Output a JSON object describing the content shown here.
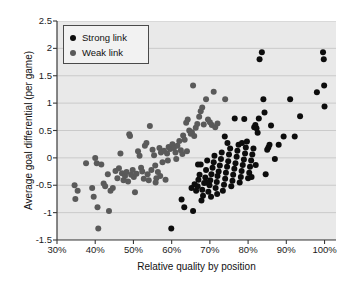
{
  "chart_data": {
    "type": "scatter",
    "title": "",
    "xlabel": "Relative quality by position",
    "ylabel": "Average goal differential (per game)",
    "xlim": [
      30,
      103
    ],
    "ylim": [
      -1.5,
      2.5
    ],
    "xticks": [
      "30%",
      "40%",
      "50%",
      "60%",
      "70%",
      "80%",
      "90%",
      "100%"
    ],
    "xtick_values": [
      30,
      40,
      50,
      60,
      70,
      80,
      90,
      100
    ],
    "yticks": [
      "2.5",
      "2",
      "1.5",
      "1",
      "0.5",
      "0",
      "-0.5",
      "-1",
      "-1.5"
    ],
    "ytick_values": [
      2.5,
      2,
      1.5,
      1,
      0.5,
      0,
      -0.5,
      -1,
      -1.5
    ],
    "grid": "horizontal",
    "legend_position": "top-left",
    "plot_background": "#e9e9e9",
    "series": [
      {
        "name": "Strong link",
        "color": "#0d0d0d",
        "marker": "circle",
        "points": [
          [
            59.9,
            -1.29
          ],
          [
            62.6,
            -0.76
          ],
          [
            65.6,
            -0.97
          ],
          [
            63.3,
            -0.9
          ],
          [
            65.2,
            -0.55
          ],
          [
            66.0,
            -0.48
          ],
          [
            66.4,
            -0.6
          ],
          [
            66.8,
            -0.52
          ],
          [
            67.0,
            -0.4
          ],
          [
            67.3,
            -0.31
          ],
          [
            67.6,
            -0.12
          ],
          [
            68.0,
            -0.58
          ],
          [
            68.2,
            -0.69
          ],
          [
            68.5,
            -0.46
          ],
          [
            68.8,
            -0.36
          ],
          [
            69.0,
            -0.22
          ],
          [
            69.3,
            -0.05
          ],
          [
            69.6,
            -0.62
          ],
          [
            69.9,
            -0.5
          ],
          [
            70.1,
            -0.41
          ],
          [
            70.4,
            -0.3
          ],
          [
            70.7,
            -0.18
          ],
          [
            71.0,
            -0.08
          ],
          [
            71.2,
            0.04
          ],
          [
            71.5,
            -0.55
          ],
          [
            71.8,
            -0.44
          ],
          [
            72.0,
            -0.33
          ],
          [
            72.3,
            -0.25
          ],
          [
            72.6,
            -0.14
          ],
          [
            72.9,
            -0.02
          ],
          [
            73.1,
            0.1
          ],
          [
            73.4,
            -0.6
          ],
          [
            73.7,
            -0.49
          ],
          [
            74.0,
            -0.38
          ],
          [
            74.2,
            -0.27
          ],
          [
            74.5,
            -0.16
          ],
          [
            74.8,
            -0.06
          ],
          [
            75.0,
            0.06
          ],
          [
            75.3,
            0.17
          ],
          [
            75.6,
            -0.52
          ],
          [
            75.9,
            -0.42
          ],
          [
            76.1,
            -0.31
          ],
          [
            76.4,
            -0.2
          ],
          [
            76.7,
            -0.1
          ],
          [
            77.0,
            0.02
          ],
          [
            77.2,
            0.13
          ],
          [
            77.5,
            0.24
          ],
          [
            77.8,
            -0.45
          ],
          [
            78.1,
            -0.35
          ],
          [
            78.3,
            -0.24
          ],
          [
            78.6,
            -0.13
          ],
          [
            78.9,
            -0.03
          ],
          [
            79.2,
            0.08
          ],
          [
            79.4,
            0.19
          ],
          [
            79.7,
            0.3
          ],
          [
            80.0,
            -0.37
          ],
          [
            80.3,
            -0.27
          ],
          [
            80.5,
            -0.16
          ],
          [
            80.8,
            -0.05
          ],
          [
            81.1,
            0.06
          ],
          [
            81.4,
            0.17
          ],
          [
            81.6,
            0.56
          ],
          [
            81.9,
            0.6
          ],
          [
            82.2,
            0.54
          ],
          [
            82.5,
            0.46
          ],
          [
            82.8,
            0.72
          ],
          [
            83.0,
            1.8
          ],
          [
            83.6,
            1.93
          ],
          [
            84.0,
            1.07
          ],
          [
            84.3,
            0.83
          ],
          [
            84.6,
            -0.3
          ],
          [
            85.0,
            0.15
          ],
          [
            85.3,
            0.19
          ],
          [
            85.6,
            0.24
          ],
          [
            86.0,
            0.59
          ],
          [
            87.0,
            -0.02
          ],
          [
            88.0,
            0.24
          ],
          [
            89.3,
            0.39
          ],
          [
            91.0,
            1.07
          ],
          [
            92.2,
            0.39
          ],
          [
            93.6,
            0.76
          ],
          [
            98.0,
            1.2
          ],
          [
            99.6,
            1.93
          ],
          [
            99.8,
            1.8
          ],
          [
            99.9,
            1.32
          ],
          [
            100.0,
            0.94
          ],
          [
            73.9,
            0.39
          ],
          [
            76.5,
            0.72
          ],
          [
            79.0,
            0.71
          ],
          [
            70.3,
            -0.71
          ],
          [
            67.8,
            -0.78
          ],
          [
            66.9,
            -0.12
          ],
          [
            71.9,
            -0.66
          ],
          [
            69.1,
            -0.45
          ],
          [
            74.6,
            0.27
          ],
          [
            78.4,
            0.27
          ],
          [
            80.9,
            -0.35
          ],
          [
            82.0,
            -0.13
          ]
        ]
      },
      {
        "name": "Weak link",
        "color": "#5a5a5a",
        "marker": "circle",
        "points": [
          [
            34.6,
            -0.5
          ],
          [
            34.8,
            -0.75
          ],
          [
            35.4,
            -0.6
          ],
          [
            37.6,
            -0.1
          ],
          [
            39.2,
            -0.55
          ],
          [
            39.6,
            -0.71
          ],
          [
            40.0,
            0.0
          ],
          [
            40.4,
            -0.1
          ],
          [
            40.6,
            -0.9
          ],
          [
            40.8,
            -1.29
          ],
          [
            41.6,
            -0.12
          ],
          [
            42.2,
            -0.47
          ],
          [
            42.6,
            -0.52
          ],
          [
            43.3,
            -0.3
          ],
          [
            43.6,
            -0.97
          ],
          [
            44.0,
            -0.6
          ],
          [
            44.6,
            -0.55
          ],
          [
            45.3,
            -0.24
          ],
          [
            45.8,
            -0.37
          ],
          [
            46.2,
            -0.19
          ],
          [
            46.6,
            0.08
          ],
          [
            47.0,
            -0.28
          ],
          [
            47.4,
            -0.41
          ],
          [
            47.8,
            -0.33
          ],
          [
            48.2,
            -0.26
          ],
          [
            48.6,
            -0.43
          ],
          [
            48.9,
            0.43
          ],
          [
            49.1,
            0.4
          ],
          [
            49.4,
            -0.31
          ],
          [
            49.8,
            -0.22
          ],
          [
            50.1,
            -0.35
          ],
          [
            50.4,
            -0.63
          ],
          [
            50.8,
            -0.29
          ],
          [
            51.2,
            0.12
          ],
          [
            51.6,
            0.04
          ],
          [
            52.0,
            -0.18
          ],
          [
            52.3,
            -0.25
          ],
          [
            52.7,
            -0.38
          ],
          [
            53.0,
            0.22
          ],
          [
            53.4,
            0.27
          ],
          [
            53.7,
            -0.3
          ],
          [
            54.0,
            -0.41
          ],
          [
            54.3,
            0.58
          ],
          [
            54.7,
            -0.22
          ],
          [
            55.0,
            0.15
          ],
          [
            55.4,
            0.05
          ],
          [
            55.7,
            -0.14
          ],
          [
            56.0,
            -0.37
          ],
          [
            56.4,
            -0.26
          ],
          [
            56.8,
            0.18
          ],
          [
            57.2,
            0.1
          ],
          [
            57.6,
            -0.08
          ],
          [
            58.0,
            0.13
          ],
          [
            58.4,
            -0.4
          ],
          [
            58.8,
            0.08
          ],
          [
            59.2,
            0.2
          ],
          [
            59.6,
            0.16
          ],
          [
            60.2,
            0.25
          ],
          [
            60.6,
            0.18
          ],
          [
            61.0,
            0.1
          ],
          [
            61.5,
            0.22
          ],
          [
            62.0,
            0.31
          ],
          [
            62.4,
            0.14
          ],
          [
            63.0,
            0.41
          ],
          [
            63.4,
            0.33
          ],
          [
            63.8,
            0.64
          ],
          [
            64.2,
            0.7
          ],
          [
            64.6,
            0.5
          ],
          [
            65.0,
            0.44
          ],
          [
            65.3,
            0.47
          ],
          [
            65.6,
            1.32
          ],
          [
            65.9,
            0.4
          ],
          [
            66.3,
            0.55
          ],
          [
            66.7,
            0.62
          ],
          [
            67.2,
            0.75
          ],
          [
            67.6,
            0.85
          ],
          [
            68.0,
            0.92
          ],
          [
            68.4,
            0.61
          ],
          [
            69.0,
            1.07
          ],
          [
            69.5,
            0.7
          ],
          [
            70.0,
            0.65
          ],
          [
            70.5,
            0.6
          ],
          [
            71.0,
            1.21
          ],
          [
            71.4,
            0.56
          ],
          [
            72.0,
            0.63
          ],
          [
            74.0,
            1.07
          ],
          [
            64.0,
            0.12
          ],
          [
            62.8,
            0.07
          ],
          [
            61.2,
            -0.02
          ],
          [
            59.0,
            -0.05
          ],
          [
            57.0,
            -0.33
          ],
          [
            55.8,
            -0.45
          ]
        ]
      }
    ]
  },
  "legend": {
    "items": [
      {
        "label": "Strong link",
        "color": "#0d0d0d"
      },
      {
        "label": "Weak link",
        "color": "#5a5a5a"
      }
    ]
  }
}
